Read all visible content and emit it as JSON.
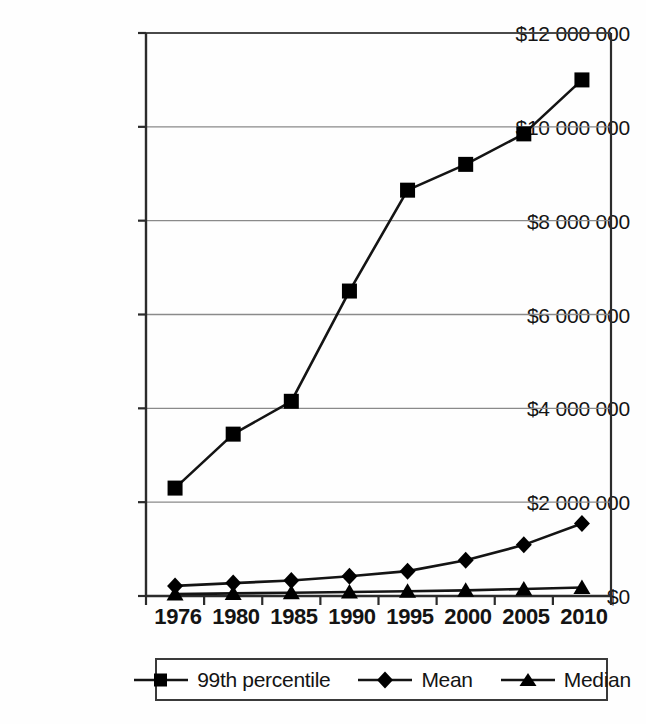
{
  "chart_data": {
    "type": "line",
    "title": "",
    "subtitle": "",
    "xlabel": "",
    "ylabel": "",
    "categories": [
      "1976",
      "1980",
      "1985",
      "1990",
      "1995",
      "2000",
      "2005",
      "2010"
    ],
    "ylim": [
      0,
      12000000
    ],
    "ytick_values": [
      0,
      2000000,
      4000000,
      6000000,
      8000000,
      10000000,
      12000000
    ],
    "ytick_labels": [
      "$0",
      "$2 000 000",
      "$4 000 000",
      "$6 000 000",
      "$8 000 000",
      "$10 000 000",
      "$12 000 000"
    ],
    "grid": "horizontal",
    "legend_position": "bottom",
    "series": [
      {
        "name": "99th percentile",
        "marker": "square",
        "values": [
          2300000,
          3450000,
          4150000,
          6500000,
          8650000,
          9200000,
          9850000,
          11000000
        ]
      },
      {
        "name": "Mean",
        "marker": "diamond",
        "values": [
          215000,
          275000,
          330000,
          420000,
          530000,
          760000,
          1090000,
          1545000
        ]
      },
      {
        "name": "Median",
        "marker": "triangle",
        "values": [
          40000,
          55000,
          70000,
          85000,
          100000,
          120000,
          150000,
          180000
        ]
      }
    ]
  },
  "axis": {
    "ytick_0": "$0",
    "ytick_1": "$2 000 000",
    "ytick_2": "$4 000 000",
    "ytick_3": "$6 000 000",
    "ytick_4": "$8 000 000",
    "ytick_5": "$10 000 000",
    "ytick_6": "$12 000 000",
    "xtick_0": "1976",
    "xtick_1": "1980",
    "xtick_2": "1985",
    "xtick_3": "1990",
    "xtick_4": "1995",
    "xtick_5": "2000",
    "xtick_6": "2005",
    "xtick_7": "2010"
  },
  "legend": {
    "entries": [
      {
        "label": "99th percentile",
        "marker": "square-marker-icon"
      },
      {
        "label": "Mean",
        "marker": "diamond-marker-icon"
      },
      {
        "label": "Median",
        "marker": "triangle-marker-icon"
      }
    ]
  },
  "colors": {
    "series_line": "#141414",
    "marker": "#000000",
    "grid": "#8a8a8a",
    "axis": "#2b2b2b",
    "background": "#fefefe",
    "text": "#141414"
  }
}
